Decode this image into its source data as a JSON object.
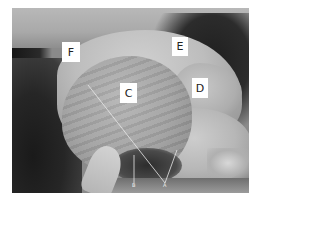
{
  "figure": {
    "labels": [
      {
        "id": "F",
        "text": "F"
      },
      {
        "id": "E",
        "text": "E"
      },
      {
        "id": "D",
        "text": "D"
      },
      {
        "id": "C",
        "text": "C"
      },
      {
        "id": "B",
        "text": "B"
      },
      {
        "id": "A",
        "text": "A"
      }
    ],
    "colors": {
      "label_box": "#ffffff",
      "label_text": "#222222",
      "pointer_line": "#e8e8e8"
    }
  }
}
